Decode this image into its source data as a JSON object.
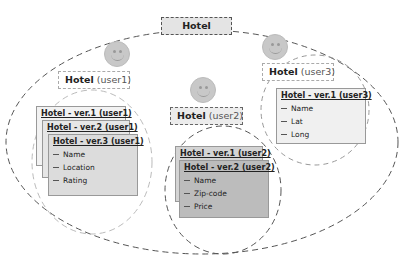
{
  "title": "Hotel",
  "users": [
    {
      "name": "user1",
      "header": {
        "bold": "Hotel",
        "user": "(user1)"
      },
      "versions": [
        {
          "title": "Hotel - ver.1 (user1)",
          "fields": []
        },
        {
          "title": "Hotel - ver.2 (user1)",
          "fields": []
        },
        {
          "title": "Hotel - ver.3 (user1)",
          "fields": [
            "Name",
            "Location",
            "Rating"
          ]
        }
      ]
    },
    {
      "name": "user2",
      "header": {
        "bold": "Hotel",
        "user": "(user2)"
      },
      "versions": [
        {
          "title": "Hotel - ver.1 (user2)",
          "fields": []
        },
        {
          "title": "Hotel - ver.2 (user2)",
          "fields": [
            "Name",
            "Zip-code",
            "Price"
          ]
        }
      ]
    },
    {
      "name": "user3",
      "header": {
        "bold": "Hotel",
        "user": "(user3)"
      },
      "versions": [
        {
          "title": "Hotel - ver.1 (user3)",
          "fields": [
            "Name",
            "Lat",
            "Long"
          ]
        }
      ]
    }
  ],
  "colors": {
    "face": "#c8c8c8",
    "card_light": "#eeeeee",
    "card_mid": "#d8d8d8",
    "card_dark": "#bdbdbd"
  }
}
